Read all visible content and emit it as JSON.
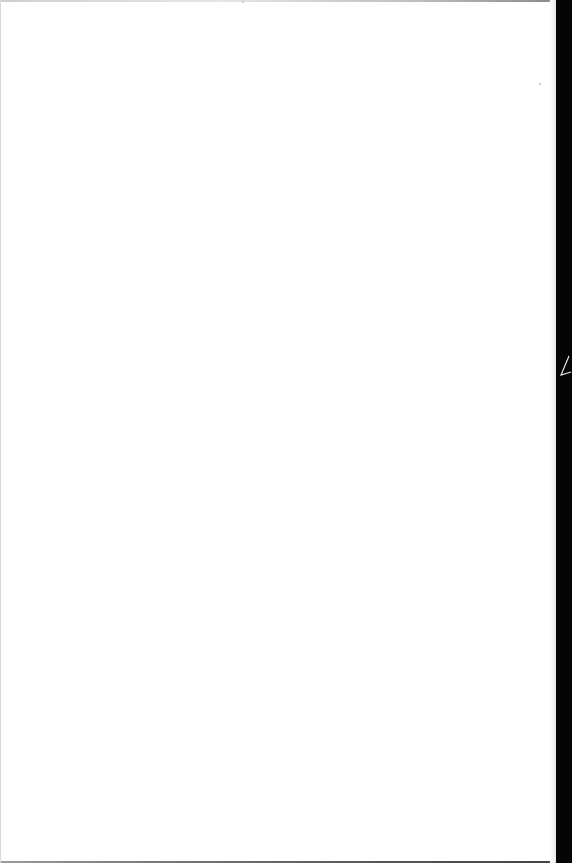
{
  "page": {
    "content": "",
    "background_color": "#ffffff",
    "edge_shadow_color": "#050505"
  }
}
